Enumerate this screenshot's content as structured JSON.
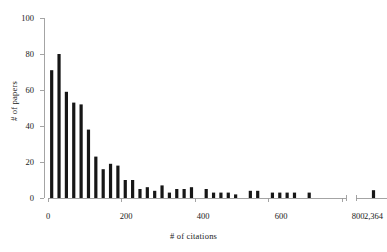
{
  "chart_data": {
    "type": "bar",
    "title": "",
    "xlabel": "# of citations",
    "ylabel": "# of papers",
    "xlim": [
      0,
      810
    ],
    "ylim": [
      0,
      100
    ],
    "grid": false,
    "legend": null,
    "bin_width": 20,
    "axis_break": {
      "present": true,
      "after": 810,
      "outlier_label": "2,364",
      "outlier_value": 2364,
      "outlier_count": 1
    },
    "x_tick_labels": [
      "0",
      "200",
      "400",
      "600",
      "800",
      "2,364"
    ],
    "x_tick_values": [
      0,
      200,
      400,
      600,
      800,
      2364
    ],
    "y_tick_labels": [
      "0",
      "20",
      "40",
      "60",
      "80",
      "100"
    ],
    "y_tick_values": [
      0,
      20,
      40,
      60,
      80,
      100
    ],
    "bin_starts": [
      0,
      20,
      40,
      60,
      80,
      100,
      120,
      140,
      160,
      180,
      200,
      220,
      240,
      260,
      280,
      300,
      320,
      340,
      360,
      380,
      400,
      420,
      440,
      460,
      480,
      500,
      520,
      540,
      560,
      580,
      600,
      620,
      640,
      660,
      680,
      700,
      720,
      740,
      760,
      780
    ],
    "values": [
      71,
      80,
      59,
      53,
      52,
      38,
      23,
      16,
      19,
      18,
      10,
      10,
      5,
      6,
      4,
      7,
      3,
      5,
      5,
      6,
      0,
      5,
      3,
      3,
      3,
      2,
      0,
      4,
      4,
      0,
      3,
      3,
      3,
      3,
      0,
      3,
      0,
      0,
      0,
      0
    ],
    "categories": [
      "0",
      "20",
      "40",
      "60",
      "80",
      "100",
      "120",
      "140",
      "160",
      "180",
      "200",
      "220",
      "240",
      "260",
      "280",
      "300",
      "320",
      "340",
      "360",
      "380",
      "400",
      "420",
      "440",
      "460",
      "480",
      "500",
      "520",
      "540",
      "560",
      "580",
      "600",
      "620",
      "640",
      "660",
      "680",
      "700",
      "720",
      "740",
      "760",
      "780"
    ],
    "bar_color": "#161616",
    "axis_color": "#9a9a9a",
    "background_color": "#ffffff"
  }
}
